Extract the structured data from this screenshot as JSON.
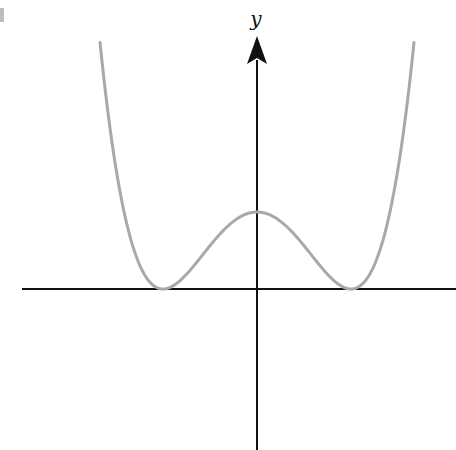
{
  "chart_data": {
    "type": "line",
    "title": "",
    "xlabel": "",
    "ylabel": "y",
    "function_description": "Symmetric quartic W-shaped curve (y = (x^2 - 1)^2 shape): two minima touching the x-axis, local maximum on the y-axis",
    "x": [
      -1.67,
      -1.5,
      -1.25,
      -1.0,
      -0.75,
      -0.5,
      -0.25,
      0.0,
      0.25,
      0.5,
      0.75,
      1.0,
      1.25,
      1.5,
      1.67
    ],
    "series": [
      {
        "name": "curve",
        "values": [
          3.2,
          1.56,
          0.32,
          0.0,
          0.19,
          0.56,
          0.88,
          1.0,
          0.88,
          0.56,
          0.19,
          0.0,
          0.32,
          1.56,
          3.2
        ]
      }
    ],
    "key_points": {
      "local_max": [
        0,
        1
      ],
      "minima": [
        [
          -1,
          0
        ],
        [
          1,
          0
        ]
      ]
    },
    "axes": {
      "x_axis": {
        "arrow": false,
        "ticks": []
      },
      "y_axis": {
        "arrow": true,
        "ticks": []
      }
    },
    "grid": false,
    "legend": null,
    "colors": {
      "curve": "#a9a9a9",
      "axes": "#111111"
    }
  },
  "labels": {
    "y_axis": "y"
  }
}
